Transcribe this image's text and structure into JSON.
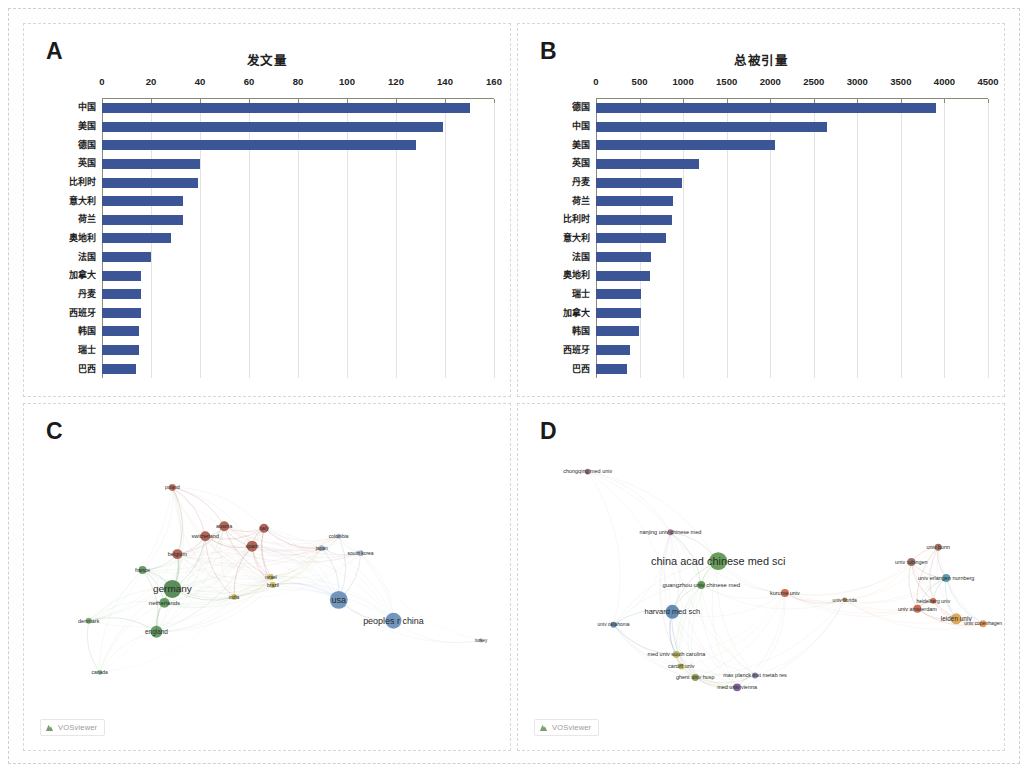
{
  "figure": {
    "panels": [
      "A",
      "B",
      "C",
      "D"
    ]
  },
  "panelA": {
    "letter": "A",
    "chart_data": {
      "type": "bar",
      "orientation": "horizontal",
      "title": "发文量",
      "xlabel": "",
      "ylabel": "",
      "xlim": [
        0,
        160
      ],
      "xticks": [
        0,
        20,
        40,
        60,
        80,
        100,
        120,
        140,
        160
      ],
      "grid": true,
      "bar_color": "#3b5596",
      "categories": [
        "中国",
        "美国",
        "德国",
        "英国",
        "比利时",
        "意大利",
        "荷兰",
        "奥地利",
        "法国",
        "加拿大",
        "丹麦",
        "西班牙",
        "韩国",
        "瑞士",
        "巴西"
      ],
      "values": [
        150,
        139,
        128,
        40,
        39,
        33,
        33,
        28,
        20,
        16,
        16,
        16,
        15,
        15,
        14
      ]
    }
  },
  "panelB": {
    "letter": "B",
    "chart_data": {
      "type": "bar",
      "orientation": "horizontal",
      "title": "总被引量",
      "xlabel": "",
      "ylabel": "",
      "xlim": [
        0,
        4500
      ],
      "xticks": [
        0,
        500,
        1000,
        1500,
        2000,
        2500,
        3000,
        3500,
        4000,
        4500
      ],
      "grid": true,
      "bar_color": "#3b5596",
      "categories": [
        "德国",
        "中国",
        "美国",
        "英国",
        "丹麦",
        "荷兰",
        "比利时",
        "意大利",
        "法国",
        "奥地利",
        "瑞士",
        "加拿大",
        "韩国",
        "西班牙",
        "巴西"
      ],
      "values": [
        3900,
        2650,
        2050,
        1180,
        990,
        880,
        870,
        800,
        630,
        620,
        520,
        520,
        490,
        390,
        360
      ]
    }
  },
  "panelC": {
    "letter": "C",
    "watermark": "VOSviewer",
    "map": {
      "type": "network",
      "nodes": [
        {
          "label": "usa",
          "x": 330,
          "y": 595,
          "r": 9,
          "color": "#5b84b1",
          "font": 9
        },
        {
          "label": "peoples r china",
          "x": 385,
          "y": 616,
          "r": 8,
          "color": "#5b84b1",
          "font": 9
        },
        {
          "label": "germany",
          "x": 163,
          "y": 584,
          "r": 9,
          "color": "#3f7a3f",
          "font": 10
        },
        {
          "label": "netherlands",
          "x": 155,
          "y": 598,
          "r": 5,
          "color": "#4e8c4e",
          "font": 6
        },
        {
          "label": "england",
          "x": 147,
          "y": 627,
          "r": 6,
          "color": "#4e8c4e",
          "font": 6.5
        },
        {
          "label": "denmark",
          "x": 79,
          "y": 616,
          "r": 3,
          "color": "#62a062",
          "font": 5.5
        },
        {
          "label": "france",
          "x": 133,
          "y": 565,
          "r": 4,
          "color": "#4e8c4e",
          "font": 5.5
        },
        {
          "label": "canada",
          "x": 90,
          "y": 668,
          "r": 2.5,
          "color": "#8fbb8f",
          "font": 5
        },
        {
          "label": "belgium",
          "x": 168,
          "y": 549,
          "r": 5,
          "color": "#a34b3c",
          "font": 5.5
        },
        {
          "label": "switzerland",
          "x": 196,
          "y": 531,
          "r": 5,
          "color": "#a34b3c",
          "font": 5.5
        },
        {
          "label": "austria",
          "x": 215,
          "y": 521,
          "r": 5,
          "color": "#a34b3c",
          "font": 5.5
        },
        {
          "label": "italy",
          "x": 255,
          "y": 523,
          "r": 4.5,
          "color": "#a34b3c",
          "font": 5.5
        },
        {
          "label": "spain",
          "x": 243,
          "y": 541,
          "r": 5.5,
          "color": "#a34b3c",
          "font": 5.5
        },
        {
          "label": "poland",
          "x": 163,
          "y": 482,
          "r": 3.5,
          "color": "#b8574a",
          "font": 5
        },
        {
          "label": "brazil",
          "x": 264,
          "y": 580,
          "r": 3,
          "color": "#c2b84a",
          "font": 5
        },
        {
          "label": "india",
          "x": 225,
          "y": 592,
          "r": 3,
          "color": "#c2b84a",
          "font": 5
        },
        {
          "label": "israel",
          "x": 262,
          "y": 572,
          "r": 3,
          "color": "#c2b84a",
          "font": 5
        },
        {
          "label": "japan",
          "x": 313,
          "y": 543,
          "r": 3,
          "color": "#9aa8c0",
          "font": 5
        },
        {
          "label": "colombia",
          "x": 330,
          "y": 531,
          "r": 2.5,
          "color": "#9aa8c0",
          "font": 5
        },
        {
          "label": "south korea",
          "x": 352,
          "y": 548,
          "r": 3,
          "color": "#9aa8c0",
          "font": 5
        },
        {
          "label": "turkey",
          "x": 473,
          "y": 636,
          "r": 2,
          "color": "#b0b0b0",
          "font": 4.5
        }
      ]
    }
  },
  "panelD": {
    "letter": "D",
    "watermark": "VOSviewer",
    "map": {
      "type": "network",
      "nodes": [
        {
          "label": "china acad chinese med sci",
          "x": 709,
          "y": 556,
          "r": 9,
          "color": "#4e8c3f",
          "font": 11
        },
        {
          "label": "guangzhou univ chinese med",
          "x": 692,
          "y": 580,
          "r": 4,
          "color": "#4e8c3f",
          "font": 6
        },
        {
          "label": "harvard med sch",
          "x": 663,
          "y": 607,
          "r": 7,
          "color": "#4a79a8",
          "font": 7.5
        },
        {
          "label": "univ oklahoma",
          "x": 604,
          "y": 620,
          "r": 3,
          "color": "#4a79a8",
          "font": 5
        },
        {
          "label": "nanjing univ chinese med",
          "x": 661,
          "y": 527,
          "r": 3,
          "color": "#8e5a7a",
          "font": 5.5
        },
        {
          "label": "chongqing med univ",
          "x": 578,
          "y": 466,
          "r": 3,
          "color": "#8e5a7a",
          "font": 5.5
        },
        {
          "label": "med univ south carolina",
          "x": 667,
          "y": 650,
          "r": 3.5,
          "color": "#b5ad3f",
          "font": 5.5
        },
        {
          "label": "cardiff univ",
          "x": 672,
          "y": 662,
          "r": 3,
          "color": "#b5ad3f",
          "font": 5.5
        },
        {
          "label": "ghent univ hosp",
          "x": 686,
          "y": 673,
          "r": 3.5,
          "color": "#7a8c3f",
          "font": 5.5
        },
        {
          "label": "max planck inst metab res",
          "x": 746,
          "y": 671,
          "r": 3,
          "color": "#6b6b9a",
          "font": 5.5
        },
        {
          "label": "med univ vienna",
          "x": 728,
          "y": 683,
          "r": 4,
          "color": "#6b4a8c",
          "font": 5.5
        },
        {
          "label": "kurume univ",
          "x": 776,
          "y": 588,
          "r": 4,
          "color": "#c0563a",
          "font": 5.5
        },
        {
          "label": "univ florida",
          "x": 836,
          "y": 595,
          "r": 2.5,
          "color": "#b5793a",
          "font": 5
        },
        {
          "label": "univ bonn",
          "x": 930,
          "y": 542,
          "r": 3.5,
          "color": "#8a5a4a",
          "font": 5.5
        },
        {
          "label": "univ tubingen",
          "x": 903,
          "y": 557,
          "r": 4,
          "color": "#8a5a4a",
          "font": 5.5
        },
        {
          "label": "univ erlangen nurnberg",
          "x": 938,
          "y": 573,
          "r": 4,
          "color": "#3f8ca0",
          "font": 5.5
        },
        {
          "label": "heidelberg univ",
          "x": 925,
          "y": 596,
          "r": 3,
          "color": "#c0563a",
          "font": 5
        },
        {
          "label": "univ amsterdam",
          "x": 909,
          "y": 604,
          "r": 4,
          "color": "#c0563a",
          "font": 5.5
        },
        {
          "label": "leiden univ",
          "x": 948,
          "y": 614,
          "r": 5.5,
          "color": "#d99a3f",
          "font": 6.5
        },
        {
          "label": "univ copenhagen",
          "x": 975,
          "y": 619,
          "r": 3.5,
          "color": "#e08a3a",
          "font": 5
        }
      ]
    }
  }
}
